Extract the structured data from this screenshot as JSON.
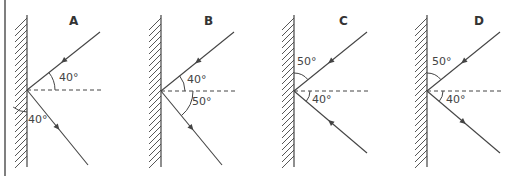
{
  "figure": {
    "border_color": "#555555",
    "line_color": "#444444",
    "panels": [
      {
        "id": "A",
        "label": "A",
        "mirror_x": 27,
        "point_y": 90,
        "angles": [
          {
            "text": "40°",
            "x": 59,
            "y": 72,
            "between": "incident ray and normal"
          },
          {
            "text": "40°",
            "x": 28,
            "y": 114,
            "between": "mirror and reflected ray"
          }
        ],
        "rays": [
          {
            "from": [
              100,
              32
            ],
            "to": [
              27,
              90
            ],
            "arrow": "in"
          },
          {
            "from": [
              27,
              90
            ],
            "to": [
              88,
              165
            ],
            "arrow": "out"
          }
        ]
      },
      {
        "id": "B",
        "label": "B",
        "mirror_x": 161,
        "point_y": 91,
        "angles": [
          {
            "text": "40°",
            "x": 187,
            "y": 74,
            "between": "incident ray and normal"
          },
          {
            "text": "50°",
            "x": 192,
            "y": 96,
            "between": "normal and reflected ray"
          }
        ],
        "rays": [
          {
            "from": [
              234,
              32
            ],
            "to": [
              161,
              91
            ],
            "arrow": "in"
          },
          {
            "from": [
              161,
              91
            ],
            "to": [
              222,
              165
            ],
            "arrow": "out"
          }
        ]
      },
      {
        "id": "C",
        "label": "C",
        "mirror_x": 294,
        "point_y": 91,
        "angles": [
          {
            "text": "50°",
            "x": 297,
            "y": 56,
            "between": "mirror and incident ray"
          },
          {
            "text": "40°",
            "x": 312,
            "y": 94,
            "between": "normal and second ray"
          }
        ],
        "rays": [
          {
            "from": [
              367,
              32
            ],
            "to": [
              294,
              91
            ],
            "arrow": "in"
          },
          {
            "from": [
              367,
              153
            ],
            "to": [
              294,
              91
            ],
            "arrow": "in"
          }
        ]
      },
      {
        "id": "D",
        "label": "D",
        "mirror_x": 427,
        "point_y": 91,
        "angles": [
          {
            "text": "50°",
            "x": 432,
            "y": 56,
            "between": "mirror and incident ray"
          },
          {
            "text": "40°",
            "x": 446,
            "y": 94,
            "between": "normal and reflected ray"
          }
        ],
        "rays": [
          {
            "from": [
              500,
              32
            ],
            "to": [
              427,
              91
            ],
            "arrow": "in"
          },
          {
            "from": [
              427,
              91
            ],
            "to": [
              500,
              153
            ],
            "arrow": "out"
          }
        ]
      }
    ]
  }
}
